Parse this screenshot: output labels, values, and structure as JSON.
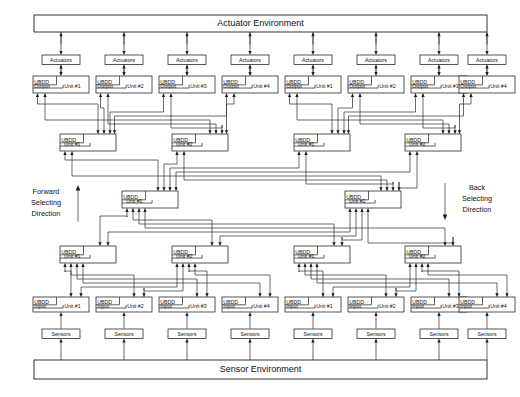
{
  "diagram": {
    "title_top": "Actuator Environment",
    "title_bottom": "Sensor Environment",
    "direction_left": {
      "line1": "Forward",
      "line2": "Selecting",
      "line3": "Direction",
      "arrow": "up-arrow-icon"
    },
    "direction_right": {
      "line1": "Back",
      "line2": "Selecting",
      "line3": "Direction",
      "arrow": "down-arrow-icon"
    },
    "actuator_label": "Actuators",
    "sensor_label": "Sensors",
    "unit_prefix": "UBDD",
    "output_word": "Output",
    "input_word": "Input",
    "unit_word": "Unit",
    "colors": {
      "line": "#2b2b2b",
      "box_fill": "#ffffff",
      "text": "#111111"
    },
    "actuators": [
      {
        "label": "Actuators"
      },
      {
        "label": "Actuators"
      },
      {
        "label": "Actuators"
      },
      {
        "label": "Actuators"
      },
      {
        "label": "Actuators"
      },
      {
        "label": "Actuators"
      },
      {
        "label": "Actuators"
      },
      {
        "label": "Actuators"
      }
    ],
    "sensors": [
      {
        "label": "Sensors"
      },
      {
        "label": "Sensors"
      },
      {
        "label": "Sensors"
      },
      {
        "label": "Sensors"
      },
      {
        "label": "Sensors"
      },
      {
        "label": "Sensors"
      },
      {
        "label": "Sensors"
      },
      {
        "label": "Sensors"
      }
    ],
    "output_units": [
      {
        "l1": "UBDD",
        "l2": "Output",
        "l3": "Unit #1"
      },
      {
        "l1": "UBDD",
        "l2": "Output",
        "l3": "Unit #2"
      },
      {
        "l1": "UBDD",
        "l2": "Output",
        "l3": "Unit #3"
      },
      {
        "l1": "UBDD",
        "l2": "Output",
        "l3": "Unit #4"
      },
      {
        "l1": "UBDD",
        "l2": "Output",
        "l3": "Unit #1"
      },
      {
        "l1": "UBDD",
        "l2": "Output",
        "l3": "Unit #2"
      },
      {
        "l1": "UBDD",
        "l2": "Output",
        "l3": "Unit #3"
      },
      {
        "l1": "UBDD",
        "l2": "Output",
        "l3": "Unit #4"
      }
    ],
    "tier2_units": [
      {
        "l1": "UBDD",
        "l2": "Unit #1"
      },
      {
        "l1": "UBDD",
        "l2": "Unit #2"
      },
      {
        "l1": "UBDD",
        "l2": "Unit #1"
      },
      {
        "l1": "UBDD",
        "l2": "Unit #2"
      }
    ],
    "tier3_units": [
      {
        "l1": "UBDD",
        "l2": "Unit #1"
      },
      {
        "l1": "UBDD",
        "l2": "Unit #2"
      }
    ],
    "tier4_units": [
      {
        "l1": "UBDD",
        "l2": "Unit #1"
      },
      {
        "l1": "UBDD",
        "l2": "Unit #2"
      },
      {
        "l1": "UBDD",
        "l2": "Unit #1"
      },
      {
        "l1": "UBDD",
        "l2": "Unit #2"
      }
    ],
    "input_units": [
      {
        "l1": "UBDD",
        "l2": "Input",
        "l3": "Unit #1"
      },
      {
        "l1": "UBDD",
        "l2": "Input",
        "l3": "Unit #2"
      },
      {
        "l1": "UBDD",
        "l2": "Input",
        "l3": "Unit #3"
      },
      {
        "l1": "UBDD",
        "l2": "Input",
        "l3": "Unit #4"
      },
      {
        "l1": "UBDD",
        "l2": "Input",
        "l3": "Unit #1"
      },
      {
        "l1": "UBDD",
        "l2": "Input",
        "l3": "Unit #2"
      },
      {
        "l1": "UBDD",
        "l2": "Input",
        "l3": "Unit #3"
      },
      {
        "l1": "UBDD",
        "l2": "Input",
        "l3": "Unit #4"
      }
    ]
  },
  "layout": {
    "col_x": [
      33,
      96,
      159,
      222,
      285,
      348,
      411,
      459
    ],
    "tier2_x": [
      60,
      172,
      294,
      405
    ],
    "tier3_x": [
      122,
      345
    ],
    "tier4_x": [
      60,
      172,
      294,
      405
    ]
  }
}
